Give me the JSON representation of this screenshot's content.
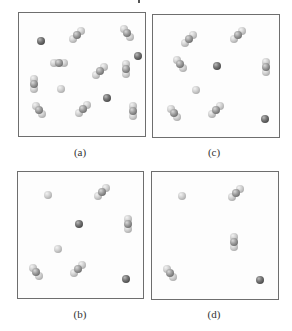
{
  "figure": {
    "panels": [
      {
        "id": "a",
        "label": "(a)",
        "box": {
          "x": 18,
          "y": 12,
          "w": 128,
          "h": 125
        },
        "label_pos": {
          "x": 80,
          "y": 146
        },
        "items": [
          {
            "type": "atom",
            "shade": "dark",
            "x": 22,
            "y": 28
          },
          {
            "type": "molecule",
            "orient": "diag-up",
            "x": 58,
            "y": 22
          },
          {
            "type": "molecule",
            "orient": "diag-down",
            "x": 108,
            "y": 20
          },
          {
            "type": "atom",
            "shade": "dark",
            "x": 119,
            "y": 43
          },
          {
            "type": "molecule",
            "orient": "horizontal",
            "x": 40,
            "y": 50
          },
          {
            "type": "molecule",
            "orient": "diag-up",
            "x": 81,
            "y": 58
          },
          {
            "type": "molecule",
            "orient": "vertical",
            "x": 107,
            "y": 56
          },
          {
            "type": "molecule",
            "orient": "vertical",
            "x": 15,
            "y": 71
          },
          {
            "type": "atom",
            "shade": "light",
            "x": 42,
            "y": 76
          },
          {
            "type": "atom",
            "shade": "dark",
            "x": 88,
            "y": 85
          },
          {
            "type": "molecule",
            "orient": "diag-down",
            "x": 20,
            "y": 97
          },
          {
            "type": "molecule",
            "orient": "diag-up",
            "x": 64,
            "y": 96
          },
          {
            "type": "molecule",
            "orient": "vertical",
            "x": 114,
            "y": 98
          }
        ]
      },
      {
        "id": "c",
        "label": "(c)",
        "box": {
          "x": 152,
          "y": 14,
          "w": 128,
          "h": 124
        },
        "label_pos": {
          "x": 214,
          "y": 146
        },
        "items": [
          {
            "type": "molecule",
            "orient": "diag-up",
            "x": 36,
            "y": 24
          },
          {
            "type": "molecule",
            "orient": "diag-up",
            "x": 85,
            "y": 20
          },
          {
            "type": "molecule",
            "orient": "diag-down",
            "x": 27,
            "y": 49
          },
          {
            "type": "atom",
            "shade": "dark",
            "x": 64,
            "y": 51
          },
          {
            "type": "molecule",
            "orient": "vertical",
            "x": 113,
            "y": 52
          },
          {
            "type": "atom",
            "shade": "light",
            "x": 43,
            "y": 75
          },
          {
            "type": "molecule",
            "orient": "diag-down",
            "x": 21,
            "y": 98
          },
          {
            "type": "molecule",
            "orient": "diag-up",
            "x": 63,
            "y": 95
          },
          {
            "type": "atom",
            "shade": "dark",
            "x": 112,
            "y": 104
          }
        ]
      },
      {
        "id": "b",
        "label": "(b)",
        "box": {
          "x": 17,
          "y": 171,
          "w": 127,
          "h": 128
        },
        "label_pos": {
          "x": 80,
          "y": 308
        },
        "items": [
          {
            "type": "atom",
            "shade": "light",
            "x": 30,
            "y": 23
          },
          {
            "type": "molecule",
            "orient": "diag-up",
            "x": 84,
            "y": 20
          },
          {
            "type": "atom",
            "shade": "dark",
            "x": 61,
            "y": 52
          },
          {
            "type": "molecule",
            "orient": "vertical",
            "x": 110,
            "y": 52
          },
          {
            "type": "atom",
            "shade": "light",
            "x": 40,
            "y": 77
          },
          {
            "type": "molecule",
            "orient": "diag-down",
            "x": 18,
            "y": 100
          },
          {
            "type": "molecule",
            "orient": "diag-up",
            "x": 60,
            "y": 97
          },
          {
            "type": "atom",
            "shade": "dark",
            "x": 108,
            "y": 107
          }
        ]
      },
      {
        "id": "d",
        "label": "(d)",
        "box": {
          "x": 151,
          "y": 171,
          "w": 128,
          "h": 129
        },
        "label_pos": {
          "x": 214,
          "y": 308
        },
        "items": [
          {
            "type": "atom",
            "shade": "light",
            "x": 30,
            "y": 24
          },
          {
            "type": "molecule",
            "orient": "diag-up",
            "x": 84,
            "y": 21
          },
          {
            "type": "molecule",
            "orient": "vertical",
            "x": 82,
            "y": 70
          },
          {
            "type": "molecule",
            "orient": "diag-down",
            "x": 18,
            "y": 101
          },
          {
            "type": "atom",
            "shade": "dark",
            "x": 108,
            "y": 108
          }
        ]
      }
    ]
  }
}
